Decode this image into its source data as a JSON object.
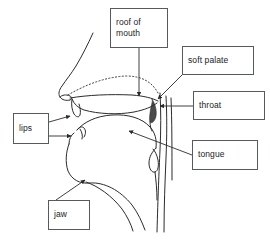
{
  "figure": {
    "background_color": "#ffffff",
    "line_color": "#2b2b2b",
    "box_border_color": "#555a5e",
    "text_color": "#222222",
    "width": 270,
    "height": 242
  },
  "labels": [
    {
      "id": "roof-of-mouth",
      "text": "roof of\nmouth",
      "box": {
        "x": 110,
        "y": 8,
        "w": 58,
        "h": 40
      },
      "leader": {
        "kind": "straight-arrow",
        "from": [
          139,
          48
        ],
        "to": [
          139,
          97
        ]
      }
    },
    {
      "id": "soft-palate",
      "text": "soft palate",
      "box": {
        "x": 182,
        "y": 46,
        "w": 72,
        "h": 29
      },
      "leader": {
        "kind": "diagonal-arrow",
        "from": [
          182,
          75
        ],
        "to": [
          157,
          98
        ]
      }
    },
    {
      "id": "throat",
      "text": "throat",
      "box": {
        "x": 193,
        "y": 91,
        "w": 72,
        "h": 29
      },
      "leader": {
        "kind": "horizontal-arrow",
        "from": [
          193,
          106
        ],
        "to": [
          156,
          106
        ]
      }
    },
    {
      "id": "tongue",
      "text": "tongue",
      "box": {
        "x": 192,
        "y": 140,
        "w": 66,
        "h": 30
      },
      "leader": {
        "kind": "diagonal-arrow",
        "from": [
          192,
          155
        ],
        "to": [
          129,
          131
        ]
      }
    },
    {
      "id": "lips",
      "text": "lips",
      "box": {
        "x": 13,
        "y": 113,
        "w": 36,
        "h": 31
      },
      "leaders": [
        {
          "kind": "diagonal-arrow",
          "from": [
            49,
            122
          ],
          "to": [
            72,
            116
          ]
        },
        {
          "kind": "horizontal-arrow",
          "from": [
            49,
            136
          ],
          "to": [
            73,
            136
          ]
        }
      ]
    },
    {
      "id": "jaw",
      "text": "jaw",
      "box": {
        "x": 48,
        "y": 200,
        "w": 42,
        "h": 30
      },
      "leader": {
        "kind": "diagonal-arrow",
        "from": [
          56,
          200
        ],
        "to": [
          84,
          180
        ]
      }
    }
  ],
  "anatomy_parts": [
    "nose-profile",
    "nasal-cavity-dotted-line",
    "hard-palate",
    "soft-palate-velum",
    "upper-lip",
    "lower-lip",
    "tongue-body",
    "pharynx-wall",
    "epiglottis",
    "jaw-chin-contour",
    "neck-outline"
  ]
}
